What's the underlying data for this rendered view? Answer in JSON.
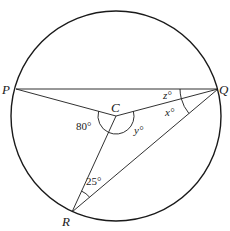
{
  "diagram": {
    "type": "circle-geometry",
    "stroke_color": "#1a1a1a",
    "circle": {
      "cx": 116,
      "cy": 116,
      "r": 105
    },
    "points": {
      "P": {
        "label": "P",
        "x": 16,
        "y": 89
      },
      "Q": {
        "label": "Q",
        "x": 218,
        "y": 89
      },
      "C": {
        "label": "C",
        "x": 116,
        "y": 116
      },
      "R": {
        "label": "R",
        "x": 72,
        "y": 212
      }
    },
    "segments": [
      "PQ",
      "PC",
      "CQ",
      "CR",
      "RQ"
    ],
    "angles": {
      "PCR": {
        "label": "80°"
      },
      "RCQ": {
        "label": "y°"
      },
      "PQC": {
        "label": "z°"
      },
      "CQR": {
        "label": "x°"
      },
      "CRQ": {
        "label": "25°"
      }
    }
  }
}
